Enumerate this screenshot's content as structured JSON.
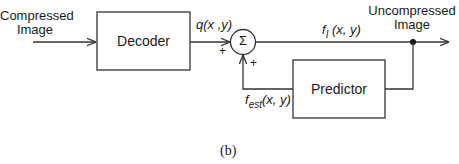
{
  "diagram": {
    "input_label_line1": "Compressed",
    "input_label_line2": "Image",
    "output_label_line1": "Uncompressed",
    "output_label_line2": "Image",
    "decoder_label": "Decoder",
    "predictor_label": "Predictor",
    "summer_symbol": "Σ",
    "signal_q": "q(x ,y)",
    "signal_f_base": "f",
    "signal_f_sub": "I",
    "signal_f_args": "(x, y)",
    "signal_fest_base": "f",
    "signal_fest_sub": "est",
    "signal_fest_args": "(x, y)",
    "plus_top": "+",
    "plus_bottom": "+",
    "caption": "(b)"
  }
}
